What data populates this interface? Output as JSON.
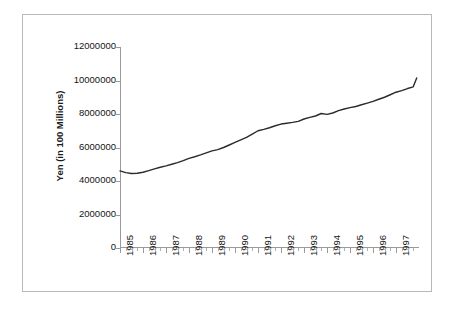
{
  "chart_data": {
    "type": "line",
    "title": "",
    "xlabel": "",
    "ylabel": "Yen (in 100 Millions)",
    "ylim": [
      0,
      12000000
    ],
    "xlim": [
      1985,
      1998
    ],
    "grid": false,
    "legend": false,
    "y_ticks": [
      0,
      2000000,
      4000000,
      6000000,
      8000000,
      10000000,
      12000000
    ],
    "y_tick_labels": [
      "0",
      "2000000",
      "4000000",
      "6000000",
      "8000000",
      "10000000",
      "12000000"
    ],
    "x_tick_labels": [
      "1985",
      "1986",
      "1987",
      "1988",
      "1989",
      "1990",
      "1991",
      "1992",
      "1993",
      "1994",
      "1995",
      "1996",
      "1997"
    ],
    "minor_ticks_per_year": 4,
    "line_color": "#2b2b2b",
    "series": [
      {
        "name": "Yen (in 100 Millions)",
        "x": [
          1985.0,
          1985.25,
          1985.5,
          1985.75,
          1986.0,
          1986.25,
          1986.5,
          1986.75,
          1987.0,
          1987.25,
          1987.5,
          1987.75,
          1988.0,
          1988.25,
          1988.5,
          1988.75,
          1989.0,
          1989.25,
          1989.5,
          1989.75,
          1990.0,
          1990.25,
          1990.5,
          1990.75,
          1991.0,
          1991.25,
          1991.5,
          1991.75,
          1992.0,
          1992.25,
          1992.5,
          1992.75,
          1993.0,
          1993.25,
          1993.5,
          1993.75,
          1994.0,
          1994.25,
          1994.5,
          1994.75,
          1995.0,
          1995.25,
          1995.5,
          1995.75,
          1996.0,
          1996.25,
          1996.5,
          1996.75,
          1997.0,
          1997.25,
          1997.5,
          1997.75
        ],
        "values": [
          4600000,
          4500000,
          4450000,
          4460000,
          4520000,
          4620000,
          4720000,
          4820000,
          4900000,
          5000000,
          5100000,
          5220000,
          5350000,
          5450000,
          5560000,
          5680000,
          5800000,
          5870000,
          6000000,
          6150000,
          6300000,
          6450000,
          6600000,
          6800000,
          7000000,
          7080000,
          7180000,
          7300000,
          7400000,
          7450000,
          7500000,
          7560000,
          7700000,
          7800000,
          7880000,
          8030000,
          7980000,
          8060000,
          8200000,
          8300000,
          8380000,
          8450000,
          8550000,
          8650000,
          8750000,
          8880000,
          9000000,
          9150000,
          9300000,
          9400000,
          9520000,
          9620000
        ]
      }
    ],
    "end_value": 10150000
  }
}
